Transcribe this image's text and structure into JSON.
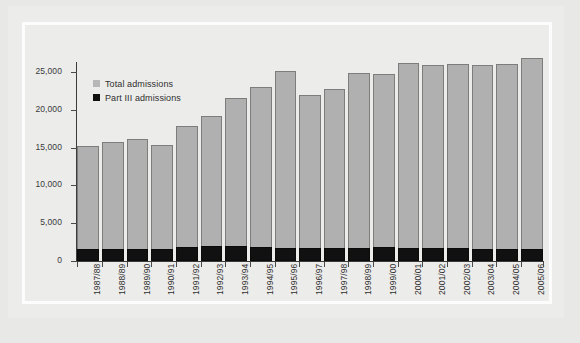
{
  "chart_data": {
    "type": "bar",
    "subtype": "stacked",
    "title": "",
    "xlabel": "",
    "ylabel": "",
    "ylim": [
      0,
      27500
    ],
    "yticks": [
      0,
      5000,
      10000,
      15000,
      20000,
      25000
    ],
    "ytick_labels": [
      "0",
      "5,000",
      "10,000",
      "15,000",
      "20,000",
      "25,000"
    ],
    "grid": false,
    "legend_position": "upper left inside",
    "categories": [
      "1987/88",
      "1988/89",
      "1989/90",
      "1990/91",
      "1991/92",
      "1992/93",
      "1993/94",
      "1994/95",
      "1995/96",
      "1996/97",
      "1997/98",
      "1998/99",
      "1999/00",
      "2000/01",
      "2001/02",
      "2002/03",
      "2003/04",
      "2004/05",
      "2005/06"
    ],
    "series": [
      {
        "name": "Total admissions",
        "color": "#b0b0b0",
        "values": [
          15200,
          15800,
          16100,
          15400,
          17900,
          19200,
          21500,
          23000,
          25200,
          22000,
          22700,
          24900,
          24800,
          26200,
          25900,
          26000,
          25900,
          26000,
          26800
        ]
      },
      {
        "name": "Part III admissions",
        "color": "#111111",
        "values": [
          1600,
          1600,
          1600,
          1600,
          1800,
          2000,
          2000,
          1800,
          1700,
          1700,
          1700,
          1700,
          1800,
          1700,
          1700,
          1700,
          1600,
          1600,
          1600
        ]
      }
    ]
  },
  "legend": {
    "items": [
      {
        "label": "Total admissions",
        "swatch": "#b7b7b7"
      },
      {
        "label": "Part III admissions",
        "swatch": "#101010"
      }
    ]
  }
}
